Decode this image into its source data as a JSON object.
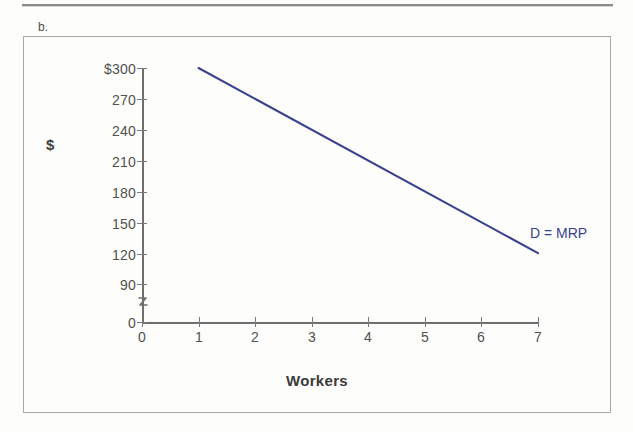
{
  "page": {
    "part_label": "b.",
    "background_color": "#fdfdfb",
    "frame_border_color": "#a9a9a9",
    "rule_color": "#8c8c8c"
  },
  "chart_data": {
    "type": "line",
    "title": "",
    "xlabel": "Workers",
    "ylabel": "$",
    "x": [
      1,
      7
    ],
    "xlim": [
      0,
      7
    ],
    "ylim": [
      0,
      300
    ],
    "y_axis_break": true,
    "y_axis_break_symbol": "≈",
    "grid": false,
    "legend_position": "inline-right",
    "series": [
      {
        "name": "D = MRP",
        "label": "D = MRP",
        "color": "#3b4190",
        "points": [
          {
            "x": 1,
            "y": 300
          },
          {
            "x": 7,
            "y": 120
          }
        ],
        "values": [
          300,
          120
        ]
      }
    ],
    "x_tick_labels": [
      "0",
      "1",
      "2",
      "3",
      "4",
      "5",
      "6",
      "7"
    ],
    "x_tick_values": [
      0,
      1,
      2,
      3,
      4,
      5,
      6,
      7
    ],
    "y_tick_labels": [
      "$300",
      "270",
      "240",
      "210",
      "180",
      "150",
      "120",
      "90",
      "0"
    ],
    "y_tick_values": [
      300,
      270,
      240,
      210,
      180,
      150,
      120,
      90,
      0
    ],
    "annotations": [
      {
        "text": "D = MRP",
        "x": 7,
        "y": 140
      }
    ],
    "line_color": "#3b4190",
    "axis_color": "#6e6e6e",
    "tick_label_color": "#515151"
  }
}
